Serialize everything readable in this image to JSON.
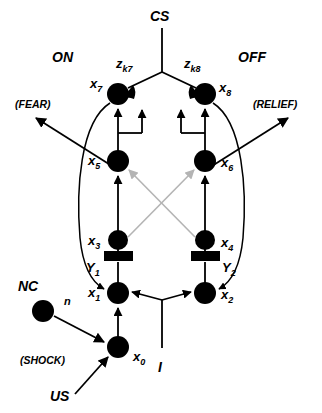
{
  "diagram": {
    "colors": {
      "ink": "#000000",
      "crossed_connection": "#b4b4b4",
      "background": "#ffffff"
    },
    "labels": {
      "cs": "CS",
      "us": "US",
      "nc": "NC",
      "on": "ON",
      "off": "OFF",
      "fear": "(FEAR)",
      "relief": "(RELIEF)",
      "shock": "(SHOCK)",
      "input_i": "I",
      "n": "n",
      "z_k7_base": "z",
      "z_k7_sub": "k7",
      "z_k8_base": "z",
      "z_k8_sub": "k8",
      "y1_base": "Y",
      "y1_sub": "1",
      "y2_base": "Y",
      "y2_sub": "2"
    },
    "nodes": [
      {
        "id": "x0",
        "base": "x",
        "sub": "0",
        "cx": 118,
        "cy": 347,
        "r": 11,
        "label_x": 133,
        "label_y": 361
      },
      {
        "id": "x1",
        "base": "x",
        "sub": "1",
        "cx": 118,
        "cy": 293,
        "r": 11,
        "label_x": 88,
        "label_y": 297
      },
      {
        "id": "x2",
        "base": "x",
        "sub": "2",
        "cx": 205,
        "cy": 293,
        "r": 11,
        "label_x": 221,
        "label_y": 299
      },
      {
        "id": "x3",
        "base": "x",
        "sub": "3",
        "cx": 118,
        "cy": 240,
        "r": 10,
        "label_x": 88,
        "label_y": 245
      },
      {
        "id": "x4",
        "base": "x",
        "sub": "4",
        "cx": 205,
        "cy": 240,
        "r": 10,
        "label_x": 221,
        "label_y": 247
      },
      {
        "id": "x5",
        "base": "x",
        "sub": "5",
        "cx": 118,
        "cy": 161,
        "r": 11,
        "label_x": 88,
        "label_y": 165
      },
      {
        "id": "x6",
        "base": "x",
        "sub": "6",
        "cx": 205,
        "cy": 161,
        "r": 11,
        "label_x": 221,
        "label_y": 167
      },
      {
        "id": "x7",
        "base": "x",
        "sub": "7",
        "cx": 118,
        "cy": 94,
        "r": 11,
        "label_x": 90,
        "label_y": 88
      },
      {
        "id": "x8",
        "base": "x",
        "sub": "8",
        "cx": 205,
        "cy": 94,
        "r": 11,
        "label_x": 219,
        "label_y": 92
      },
      {
        "id": "nc",
        "base": "",
        "sub": "",
        "cx": 43,
        "cy": 311,
        "r": 11,
        "label_x": 0,
        "label_y": 0
      }
    ],
    "gates": [
      {
        "id": "y1-gate",
        "x": 104,
        "y": 252,
        "w": 29,
        "h": 9
      },
      {
        "id": "y2-gate",
        "x": 191,
        "y": 252,
        "w": 29,
        "h": 9
      }
    ],
    "connections": [
      {
        "id": "cs-trunk",
        "from": "CS",
        "to": "junction",
        "style": "solid"
      },
      {
        "id": "cs-to-x7",
        "from": "CS",
        "to": "x7",
        "style": "synapse"
      },
      {
        "id": "cs-to-x8",
        "from": "CS",
        "to": "x8",
        "style": "synapse"
      },
      {
        "id": "x5-to-x7",
        "from": "x5",
        "to": "x7",
        "style": "arrow"
      },
      {
        "id": "x6-to-x8",
        "from": "x6",
        "to": "x8",
        "style": "arrow"
      },
      {
        "id": "x7-recurrent",
        "from": "x7",
        "to": "x7",
        "style": "feedback-arrow"
      },
      {
        "id": "x8-recurrent",
        "from": "x8",
        "to": "x8",
        "style": "feedback-arrow"
      },
      {
        "id": "x3-to-x5",
        "from": "x3",
        "to": "x5",
        "style": "arrow"
      },
      {
        "id": "x4-to-x6",
        "from": "x4",
        "to": "x6",
        "style": "arrow"
      },
      {
        "id": "x3-to-x6",
        "from": "x3",
        "to": "x6",
        "style": "gray-arrow"
      },
      {
        "id": "x4-to-x5",
        "from": "x4",
        "to": "x5",
        "style": "gray-arrow"
      },
      {
        "id": "x1-to-x3",
        "from": "x1",
        "to": "x3",
        "style": "gated-line"
      },
      {
        "id": "x2-to-x4",
        "from": "x2",
        "to": "x4",
        "style": "gated-line"
      },
      {
        "id": "x0-to-x1",
        "from": "x0",
        "to": "x1",
        "style": "arrow"
      },
      {
        "id": "nc-to-x0",
        "from": "NC",
        "to": "x0",
        "style": "arrow"
      },
      {
        "id": "us-to-x0",
        "from": "US",
        "to": "x0",
        "style": "arrow"
      },
      {
        "id": "i-to-x1",
        "from": "I",
        "to": "x1",
        "style": "arrow"
      },
      {
        "id": "i-to-x2",
        "from": "I",
        "to": "x2",
        "style": "arrow"
      },
      {
        "id": "y1-loop",
        "from": "x7",
        "to": "x1",
        "style": "curved-arrow"
      },
      {
        "id": "y2-loop",
        "from": "x8",
        "to": "x2",
        "style": "curved-arrow"
      },
      {
        "id": "x5-to-fear",
        "from": "x5",
        "to": "FEAR",
        "style": "arrow"
      },
      {
        "id": "x6-to-relief",
        "from": "x6",
        "to": "RELIEF",
        "style": "arrow"
      }
    ]
  }
}
